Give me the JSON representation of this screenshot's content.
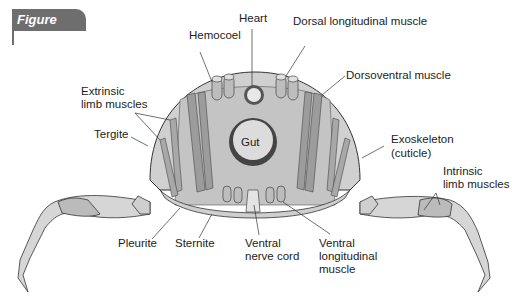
{
  "figure": {
    "label": "Figure 12.31"
  },
  "labels": {
    "heart": "Heart",
    "hemocoel": "Hemocoel",
    "dorsal_longitudinal_muscle": "Dorsal longitudinal muscle",
    "dorsoventral_muscle": "Dorsoventral muscle",
    "extrinsic_limb_muscles_1": "Extrinsic",
    "extrinsic_limb_muscles_2": "limb muscles",
    "tergite": "Tergite",
    "gut": "Gut",
    "exoskeleton_1": "Exoskeleton",
    "exoskeleton_2": "(cuticle)",
    "intrinsic_limb_muscles_1": "Intrinsic",
    "intrinsic_limb_muscles_2": "limb muscles",
    "pleurite": "Pleurite",
    "sternite": "Sternite",
    "ventral_nerve_cord_1": "Ventral",
    "ventral_nerve_cord_2": "nerve cord",
    "ventral_longitudinal_muscle_1": "Ventral",
    "ventral_longitudinal_muscle_2": "longitudinal",
    "ventral_longitudinal_muscle_3": "muscle"
  },
  "colors": {
    "figure_tab": "#6e6e6e",
    "body_fill": "#d4d4d4",
    "inner_fill": "#bdbdbd",
    "muscle": "#9a9a9a",
    "outline": "#333333"
  }
}
